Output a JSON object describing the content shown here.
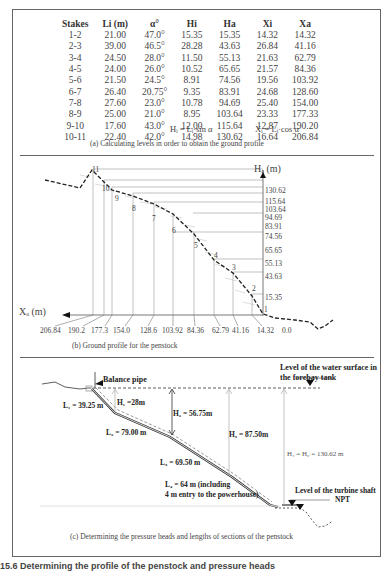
{
  "table": {
    "headers": [
      "Stakes",
      "Li (m)",
      "α°",
      "Hi",
      "Ha",
      "Xi",
      "Xa"
    ],
    "rows": [
      [
        "1-2",
        "21.00",
        "47.0°",
        "15.35",
        "15.35",
        "14.32",
        "14.32"
      ],
      [
        "2-3",
        "39.00",
        "46.5°",
        "28.28",
        "43.63",
        "26.84",
        "41.16"
      ],
      [
        "3-4",
        "24.50",
        "28.0°",
        "11.50",
        "55.13",
        "21.63",
        "62.79"
      ],
      [
        "4-5",
        "24.00",
        "26.0°",
        "10.52",
        "65.65",
        "21.57",
        "84.36"
      ],
      [
        "5-6",
        "21.50",
        "24.5°",
        "8.91",
        "74.56",
        "19.56",
        "103.92"
      ],
      [
        "6-7",
        "26.40",
        "20.75°",
        "9.35",
        "83.91",
        "24.68",
        "128.60"
      ],
      [
        "7-8",
        "27.60",
        "23.0°",
        "10.78",
        "94.69",
        "25.40",
        "154.00"
      ],
      [
        "8-9",
        "25.00",
        "21.0°",
        "8.95",
        "103.64",
        "23.33",
        "177.33"
      ],
      [
        "9-10",
        "17.60",
        "43.0°",
        "12.00",
        "115.64",
        "12.87",
        "190.20"
      ],
      [
        "10-11",
        "22.40",
        "42.0°",
        "14.98",
        "130.62",
        "16.64",
        "206.84"
      ]
    ],
    "formula_h": "Hᵢ = Lᵢ·sin α",
    "formula_x": "Xᵢ = Lᵢ·cos α",
    "caption": "(a) Calculating levels in order to obtain the ground profile"
  },
  "profile": {
    "y_axis_label": "Hₐ (m)",
    "x_axis_label": "Xₐ (m)",
    "y_ticks": [
      "130.62",
      "115.64",
      "103.64",
      "94.69",
      "83.91",
      "74.56",
      "65.65",
      "55.13",
      "43.63",
      "15.35"
    ],
    "x_ticks": [
      "206.84",
      "190.2",
      "177.3",
      "154.0",
      "128.6",
      "103.92",
      "84.36",
      "62.79",
      "41.16",
      "14.32",
      "0.0"
    ],
    "stake_labels": [
      "1",
      "2",
      "3",
      "4",
      "5",
      "6",
      "7",
      "8",
      "9",
      "10",
      "11"
    ],
    "caption": "(b) Ground profile for the penstock"
  },
  "penstock": {
    "balance_pipe": "Balance pipe",
    "water_level": "Level of the water surface in the forebay tank",
    "water_level_line1": "Level of the water surface in",
    "water_level_line2": "the forebay tank",
    "L1": "L₁ = 39.25 m",
    "L2": "L₂ = 79.00 m",
    "L3": "L₃ = 69.50 m",
    "L4_line1": "L₄ = 64 m (including",
    "L4_line2": "4 m entry to the powerhouse)",
    "H1": "H₁ =28m",
    "H2": "H₂ = 56.75m",
    "H3": "H₃ = 87.50m",
    "H4": "H₄ = H₀ = 130.62 m",
    "turbine_level": "Level of the turbine shaft",
    "npt": "NPT",
    "caption": "(c) Determining the pressure heads and lengths of sections of the penstock"
  },
  "figure_caption": "15.6 Determining the profile of the penstock and pressure heads"
}
